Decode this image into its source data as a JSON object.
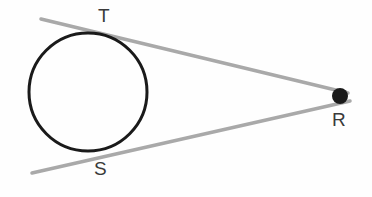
{
  "figure": {
    "background_color": "#fefefe",
    "width": 372,
    "height": 197
  },
  "labels": {
    "tangent_point_top": "T",
    "tangent_point_bottom": "S",
    "external_point": "R",
    "color": "#3a3a3a",
    "font_size_px": 19
  },
  "chart_data": {
    "type": "scatter",
    "xlabel": "",
    "ylabel": "",
    "grid": false,
    "legend": null,
    "xlim": [
      0,
      372
    ],
    "ylim": [
      0,
      197
    ],
    "shapes": [
      {
        "name": "circle",
        "kind": "circle",
        "cx": 88,
        "cy": 92,
        "r": 59,
        "stroke": "#1a1a1a",
        "stroke_width": 3,
        "fill": "none"
      },
      {
        "name": "tangent-line-upper",
        "kind": "line",
        "x1": 41,
        "y1": 19,
        "x2": 348,
        "y2": 93,
        "stroke": "#a9a9a9",
        "stroke_width": 3.5
      },
      {
        "name": "tangent-line-lower",
        "kind": "line",
        "x1": 32,
        "y1": 173,
        "x2": 350,
        "y2": 101,
        "stroke": "#a9a9a9",
        "stroke_width": 3.5
      },
      {
        "name": "point-R-dot",
        "kind": "circle",
        "cx": 340,
        "cy": 96,
        "r": 8,
        "fill": "#1a1a1a",
        "stroke": "none",
        "stroke_width": 0
      }
    ],
    "points": [
      {
        "name": "T",
        "x": 90,
        "y": 33,
        "label": "T",
        "marker": "none"
      },
      {
        "name": "S",
        "x": 96,
        "y": 151,
        "label": "S",
        "marker": "none"
      },
      {
        "name": "R",
        "x": 340,
        "y": 96,
        "label": "R",
        "marker": "filled-circle"
      }
    ],
    "colors": {
      "circle_stroke": "#1a1a1a",
      "tangent_stroke": "#a9a9a9",
      "point_fill": "#1a1a1a",
      "label_text": "#3a3a3a",
      "background": "#fefefe"
    }
  }
}
